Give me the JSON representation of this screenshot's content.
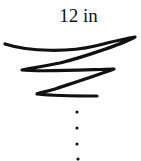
{
  "diagram": {
    "label": "12 in",
    "shape": "tapering-spiral",
    "stroke_color": "#111111",
    "dots_count": 4
  }
}
